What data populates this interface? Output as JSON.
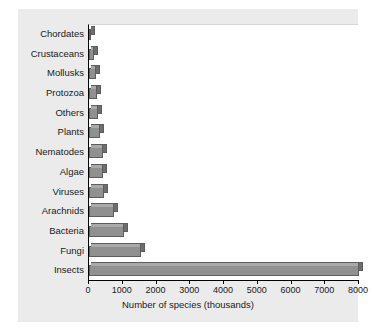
{
  "chart_data": {
    "type": "bar",
    "orientation": "horizontal",
    "title": "",
    "xlabel": "Number of species (thousands)",
    "ylabel": "",
    "xlim": [
      0,
      8000
    ],
    "xticks": [
      0,
      1000,
      2000,
      3000,
      4000,
      5000,
      6000,
      7000,
      8000
    ],
    "xtick_labels": [
      "0",
      "1000",
      "2000",
      "3000",
      "4000",
      "5000",
      "6000",
      "7000",
      "8000"
    ],
    "grid": false,
    "legend": null,
    "categories": [
      "Chordates",
      "Crustaceans",
      "Mollusks",
      "Protozoa",
      "Others",
      "Plants",
      "Nematodes",
      "Algae",
      "Viruses",
      "Arachnids",
      "Bacteria",
      "Fungi",
      "Insects"
    ],
    "values": [
      45,
      150,
      200,
      250,
      280,
      320,
      400,
      420,
      450,
      750,
      1050,
      1550,
      8000
    ],
    "bar_color": "#909090",
    "bar_edge_color": "#5d5d5d",
    "plot_background": "#ffffff",
    "figure_background": "#ebebeb"
  }
}
